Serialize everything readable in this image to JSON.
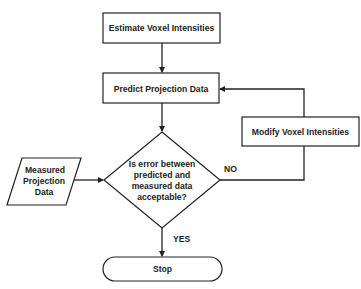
{
  "diagram": {
    "type": "flowchart",
    "colors": {
      "stroke": "#222222",
      "fill": "#ffffff",
      "text": "#222222"
    },
    "nodes": {
      "estimate": {
        "shape": "rectangle",
        "label": "Estimate Voxel Intensities"
      },
      "predict": {
        "shape": "rectangle",
        "label": "Predict Projection Data"
      },
      "modify": {
        "shape": "rectangle",
        "label": "Modify Voxel Intensities"
      },
      "measured": {
        "shape": "parallelogram",
        "lines": [
          "Measured",
          "Projection",
          "Data"
        ]
      },
      "decision": {
        "shape": "diamond",
        "lines": [
          "Is error between",
          "predicted and",
          "measured data",
          "acceptable?"
        ]
      },
      "stop": {
        "shape": "terminator",
        "label": "Stop"
      }
    },
    "edges": [
      {
        "from": "estimate",
        "to": "predict",
        "label": ""
      },
      {
        "from": "predict",
        "to": "decision",
        "label": ""
      },
      {
        "from": "measured",
        "to": "decision",
        "label": ""
      },
      {
        "from": "decision",
        "to": "modify",
        "label": "NO"
      },
      {
        "from": "modify",
        "to": "predict",
        "label": ""
      },
      {
        "from": "decision",
        "to": "stop",
        "label": "YES"
      }
    ],
    "edge_labels": {
      "no": "NO",
      "yes": "YES"
    }
  }
}
